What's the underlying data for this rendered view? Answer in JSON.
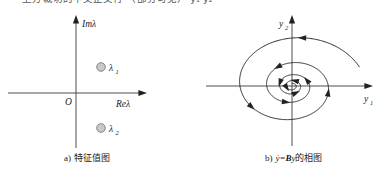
{
  "page": {
    "width": 387,
    "height": 181,
    "background": "#ffffff",
    "truncated_header_text": "—— 上方裁切的中文正文行 （部分可见） y₁ y₂ ——"
  },
  "figure": {
    "panels": [
      {
        "id": "eigenvalue-plot",
        "caption": {
          "index": "a)",
          "text": "特征值图"
        },
        "axes": {
          "vertical_label": "Im",
          "vertical_label_symbol": "λ",
          "horizontal_label": "Re",
          "horizontal_label_symbol": "λ",
          "origin_label": "O"
        },
        "points": [
          {
            "name": "lambda-1",
            "label": "λ",
            "subscript": "1",
            "re": -0.05,
            "im": 0.45,
            "marker": "open-gray-circle",
            "color": "#c9c9c9"
          },
          {
            "name": "lambda-2",
            "label": "λ",
            "subscript": "2",
            "re": -0.05,
            "im": -0.45,
            "marker": "open-gray-circle",
            "color": "#c9c9c9"
          }
        ]
      },
      {
        "id": "phase-portrait",
        "caption": {
          "index": "b)",
          "math_y": "ẏ",
          "equals": "=",
          "matrix": "B",
          "vector": "y",
          "text": "的相图"
        },
        "axes": {
          "vertical_label": "y",
          "vertical_subscript": "2",
          "horizontal_label": "y",
          "horizontal_subscript": "1"
        },
        "trajectory": {
          "type": "inward-logarithmic-spiral",
          "direction": "clockwise-inward",
          "stable": true,
          "arrow_count": 10,
          "stroke": "#222222"
        }
      }
    ]
  },
  "chart_data": [
    {
      "type": "scatter",
      "title": "a) 特征值图",
      "xlabel": "Reλ",
      "ylabel": "Imλ",
      "xlim": [
        -1,
        1
      ],
      "ylim": [
        -1,
        1
      ],
      "grid": false,
      "legend": "none",
      "annotations": [
        "O"
      ],
      "series": [
        {
          "name": "eigenvalues",
          "points": [
            {
              "label": "λ₁",
              "x": -0.05,
              "y": 0.45
            },
            {
              "label": "λ₂",
              "x": -0.05,
              "y": -0.45
            }
          ]
        }
      ]
    },
    {
      "type": "line",
      "title": "b) ẏ =By的相图",
      "xlabel": "y₁",
      "ylabel": "y₂",
      "xlim": [
        -1,
        1
      ],
      "ylim": [
        -1,
        1
      ],
      "grid": false,
      "legend": "none",
      "series": [
        {
          "name": "spiral-trajectory",
          "description": "decaying spiral converging to origin",
          "parametric": {
            "r0": 0.92,
            "decay": 0.115,
            "turns": 4.2,
            "theta_start": 0.35
          }
        }
      ]
    }
  ]
}
